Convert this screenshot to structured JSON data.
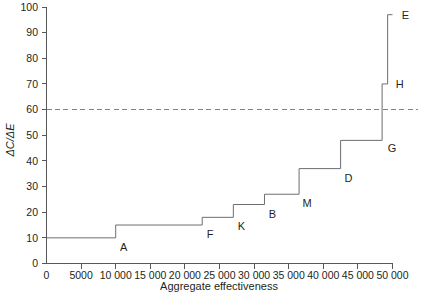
{
  "chart_data": {
    "type": "line",
    "subtype": "step-function",
    "title": "",
    "xlabel": "Aggregate effectiveness",
    "ylabel": "ΔC/ΔE",
    "xlim": [
      0,
      50000
    ],
    "ylim": [
      0,
      100
    ],
    "grid": false,
    "legend": null,
    "x_ticks": [
      0,
      5000,
      10000,
      15000,
      20000,
      25000,
      30000,
      35000,
      40000,
      45000,
      50000
    ],
    "x_tick_labels": [
      "0",
      "5000",
      "10 000",
      "15 000",
      "20 000",
      "25 000",
      "30 000",
      "35 000",
      "40 000",
      "45 000",
      "50 000"
    ],
    "y_ticks": [
      0,
      10,
      20,
      30,
      40,
      50,
      60,
      70,
      80,
      90,
      100
    ],
    "y_tick_labels": [
      "0",
      "10",
      "20",
      "30",
      "40",
      "50",
      "60",
      "70",
      "80",
      "90",
      "100"
    ],
    "threshold": {
      "value": 60,
      "style": "dashed",
      "color": "#808285",
      "label": ""
    },
    "steps": [
      {
        "label": "A",
        "x_start": 0,
        "x_end": 10000,
        "y": 10,
        "label_x": 10000,
        "label_y": 10
      },
      {
        "label": "F",
        "x_start": 10000,
        "x_end": 22500,
        "y": 15,
        "label_x": 22500,
        "label_y": 15
      },
      {
        "label": "K",
        "x_start": 22500,
        "x_end": 27000,
        "y": 18,
        "label_x": 27000,
        "label_y": 18
      },
      {
        "label": "B",
        "x_start": 27000,
        "x_end": 31500,
        "y": 23,
        "label_x": 31500,
        "label_y": 23
      },
      {
        "label": "M",
        "x_start": 31500,
        "x_end": 36500,
        "y": 27,
        "label_x": 36500,
        "label_y": 27
      },
      {
        "label": "D",
        "x_start": 36500,
        "x_end": 42500,
        "y": 37,
        "label_x": 42500,
        "label_y": 37
      },
      {
        "label": "G",
        "x_start": 42500,
        "x_end": 48500,
        "y": 48,
        "label_x": 48500,
        "label_y": 48
      },
      {
        "label": "H",
        "x_start": 48500,
        "x_end": 49300,
        "y": 70,
        "label_x": 49300,
        "label_y": 70
      },
      {
        "label": "E",
        "x_start": 49300,
        "x_end": 50000,
        "y": 97,
        "label_x": 50000,
        "label_y": 97
      }
    ],
    "series": [
      {
        "name": "Cost-effectiveness frontier",
        "color": "#6d6e71",
        "categories": [
          "A",
          "F",
          "K",
          "B",
          "M",
          "D",
          "G",
          "H",
          "E"
        ],
        "x": [
          10000,
          22500,
          27000,
          31500,
          36500,
          42500,
          48500,
          49300,
          50000
        ],
        "values": [
          10,
          15,
          18,
          23,
          27,
          37,
          48,
          70,
          97
        ]
      }
    ]
  }
}
